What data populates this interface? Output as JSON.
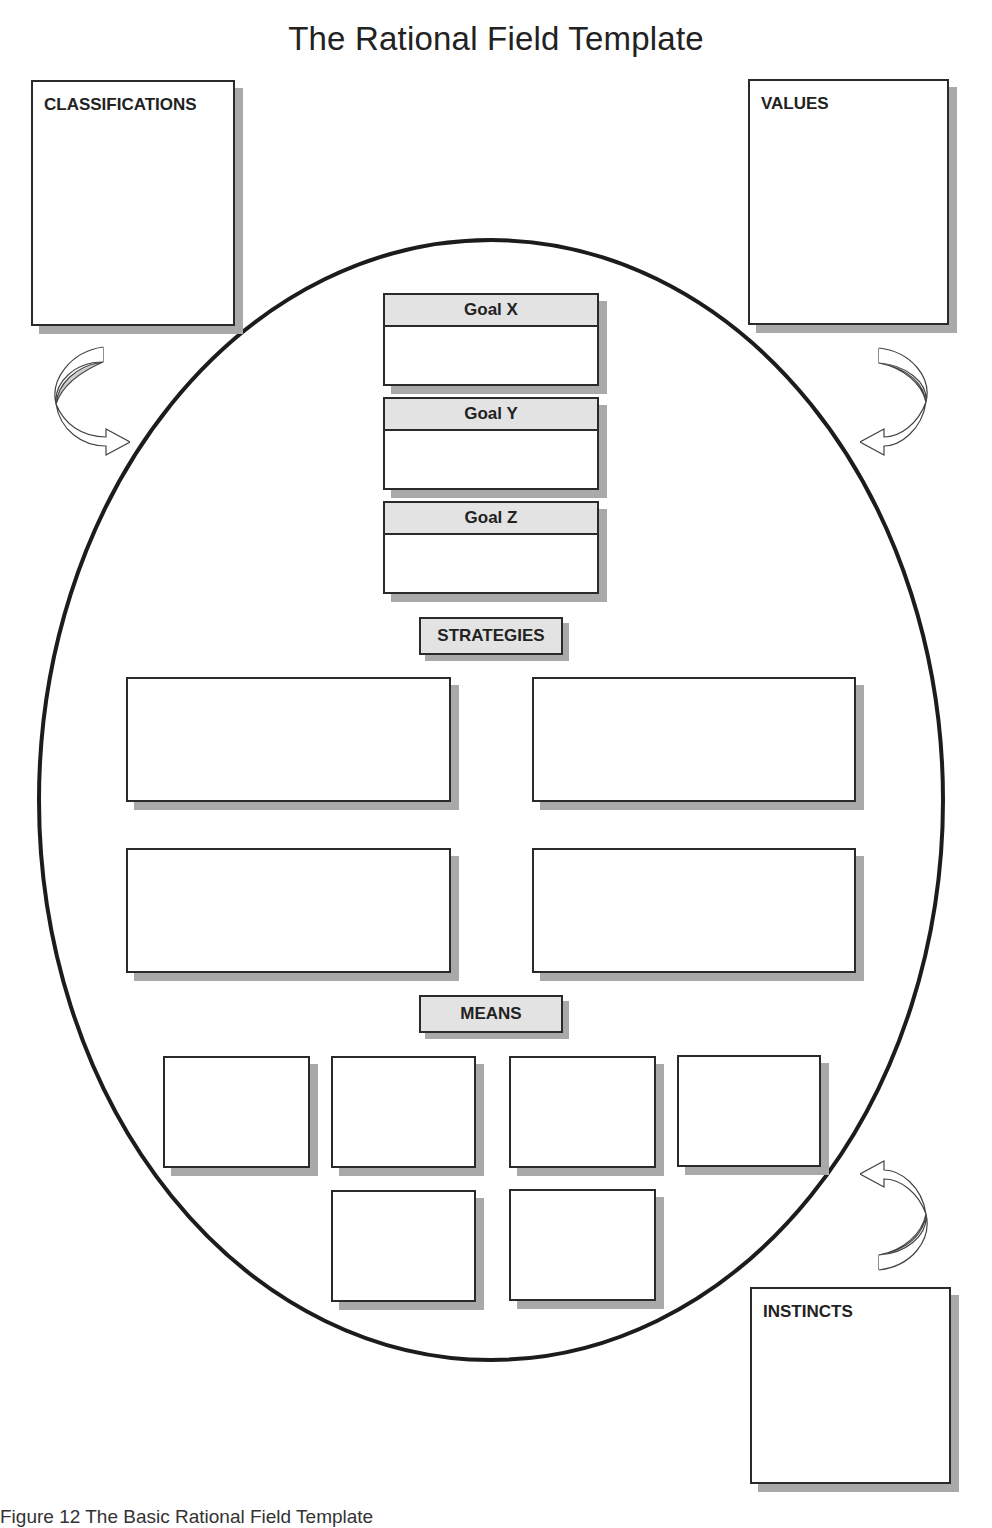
{
  "title": "The Rational Field Template",
  "corner_boxes": {
    "classifications": "CLASSIFICATIONS",
    "values": "VALUES",
    "instincts": "INSTINCTS"
  },
  "goals": [
    {
      "label": "Goal X"
    },
    {
      "label": "Goal Y"
    },
    {
      "label": "Goal Z"
    }
  ],
  "sections": {
    "strategies": "STRATEGIES",
    "means": "MEANS"
  },
  "strategy_boxes": 4,
  "means_boxes": 6,
  "caption": "Figure 12   The Basic Rational Field Template",
  "colors": {
    "stroke": "#2a2a2a",
    "header_fill": "#e3e3e3",
    "shadow": "#a9a9a9",
    "arrow_fill": "#cfcfcf"
  }
}
